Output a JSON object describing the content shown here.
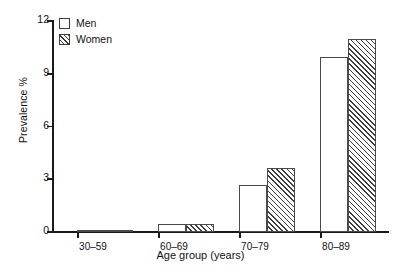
{
  "chart_data": {
    "type": "bar",
    "title": "",
    "subtitle": "",
    "xlabel": "Age group (years)",
    "ylabel": "Prevalence %",
    "categories": [
      "30–59",
      "60–69",
      "70–79",
      "80–89"
    ],
    "series": [
      {
        "name": "Men",
        "values": [
          0.05,
          0.45,
          2.65,
          9.95
        ],
        "style": "open"
      },
      {
        "name": "Women",
        "values": [
          0.05,
          0.45,
          3.65,
          11.0
        ],
        "style": "hatched"
      }
    ],
    "ylim": [
      0,
      12
    ],
    "yticks": [
      0,
      3,
      6,
      9,
      12
    ],
    "yticklabels": [
      "0",
      "3",
      "6",
      "9",
      "12"
    ],
    "grid": false,
    "legend_position": "top-left",
    "legend_entries": [
      "Men",
      "Women"
    ],
    "colors": {
      "men_fill": "#ffffff",
      "women_fill": "#ffffff",
      "women_hatch": "#3c3c3c",
      "bar_edge": "#4a4a4a",
      "axis": "#1a1a1a",
      "text": "#111111",
      "background": "#ffffff"
    }
  },
  "axis": {
    "y_title": "Prevalence %",
    "x_title": "Age group (years)",
    "y_tick_labels": [
      "0",
      "3",
      "6",
      "9",
      "12"
    ],
    "x_tick_labels": [
      "30–59",
      "60–69",
      "70–79",
      "80–89"
    ]
  },
  "legend": {
    "items": [
      {
        "label": "Men",
        "swatch": "open-square-swatch"
      },
      {
        "label": "Women",
        "swatch": "hatched-square-swatch"
      }
    ]
  }
}
